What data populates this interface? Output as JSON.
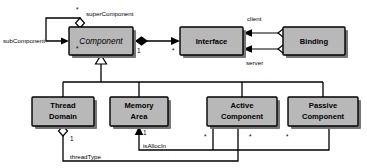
{
  "diagram": {
    "type": "uml-class-diagram",
    "background_color": "#ffffff",
    "box_fill_color": "#b8b8b8",
    "box_border_color": "#000000",
    "shadow_color": "#777777",
    "classes": [
      {
        "id": "component",
        "name": "Component",
        "abstract": true,
        "x": 69,
        "y": 27,
        "w": 64,
        "h": 28
      },
      {
        "id": "interface",
        "name": "Interface",
        "abstract": false,
        "x": 180,
        "y": 27,
        "w": 63,
        "h": 28
      },
      {
        "id": "binding",
        "name": "Binding",
        "abstract": false,
        "x": 283,
        "y": 27,
        "w": 62,
        "h": 28
      },
      {
        "id": "thread-domain",
        "name_line1": "Thread",
        "name_line2": "Domain",
        "abstract": false,
        "x": 32,
        "y": 97,
        "w": 62,
        "h": 29
      },
      {
        "id": "memory-area",
        "name_line1": "Memory",
        "name_line2": "Area",
        "abstract": false,
        "x": 110,
        "y": 97,
        "w": 58,
        "h": 29
      },
      {
        "id": "active-component",
        "name_line1": "Active",
        "name_line2": "Component",
        "abstract": false,
        "x": 207,
        "y": 97,
        "w": 70,
        "h": 29
      },
      {
        "id": "passive-component",
        "name_line1": "Passive",
        "name_line2": "Component",
        "abstract": false,
        "x": 288,
        "y": 97,
        "w": 70,
        "h": 29
      }
    ],
    "role_labels": [
      {
        "id": "super-component",
        "text": "superComponent",
        "x": 86,
        "y": 14
      },
      {
        "id": "sub-component",
        "text": "subComponent",
        "x": 3,
        "y": 41
      },
      {
        "id": "client",
        "text": "client",
        "x": 247,
        "y": 19
      },
      {
        "id": "server",
        "text": "server",
        "x": 246,
        "y": 63
      },
      {
        "id": "thread-type",
        "text": "threadType",
        "x": 70,
        "y": 157
      },
      {
        "id": "is-alloc-in",
        "text": "isAllocIn",
        "x": 143,
        "y": 146
      }
    ],
    "multiplicity_labels": [
      {
        "id": "super-component-mult",
        "text": "*",
        "x": 76,
        "y": 10
      },
      {
        "id": "sub-component-mult",
        "text": "*",
        "x": 76,
        "y": 49
      },
      {
        "id": "component-interface-mult-1",
        "text": "1",
        "x": 137,
        "y": 51
      },
      {
        "id": "component-interface-mult-star",
        "text": "*",
        "x": 172,
        "y": 51
      },
      {
        "id": "thread-type-mult",
        "text": "1",
        "x": 70,
        "y": 139
      },
      {
        "id": "is-alloc-in-mult",
        "text": "1",
        "x": 143,
        "y": 133
      },
      {
        "id": "active-left-mult",
        "text": "*",
        "x": 204,
        "y": 137
      },
      {
        "id": "active-right-mult",
        "text": "*",
        "x": 249,
        "y": 137
      },
      {
        "id": "passive-mult",
        "text": "*",
        "x": 286,
        "y": 137
      }
    ],
    "relationships": [
      {
        "id": "component-self-aggregation",
        "kind": "aggregation",
        "from": "component",
        "to": "component",
        "source_role": "subComponent",
        "target_role": "superComponent"
      },
      {
        "id": "component-interface-composition",
        "kind": "composition",
        "from": "component",
        "to": "interface",
        "source_mult": "1",
        "target_mult": "*"
      },
      {
        "id": "binding-client-interface",
        "kind": "aggregation",
        "from": "binding",
        "to": "interface",
        "role": "client"
      },
      {
        "id": "binding-server-interface",
        "kind": "aggregation",
        "from": "binding",
        "to": "interface",
        "role": "server"
      },
      {
        "id": "thread-domain-generalization",
        "kind": "generalization",
        "from": "thread-domain",
        "to": "component"
      },
      {
        "id": "memory-area-generalization",
        "kind": "generalization",
        "from": "memory-area",
        "to": "component"
      },
      {
        "id": "active-component-generalization",
        "kind": "generalization",
        "from": "active-component",
        "to": "component"
      },
      {
        "id": "passive-component-generalization",
        "kind": "generalization",
        "from": "passive-component",
        "to": "component"
      },
      {
        "id": "active-thread-domain-aggregation",
        "kind": "aggregation",
        "from": "active-component",
        "to": "thread-domain",
        "role": "threadType",
        "mult": "1"
      },
      {
        "id": "component-memory-area-association",
        "kind": "association",
        "from": "passive-component",
        "to": "memory-area",
        "role": "isAllocIn",
        "mult": "1"
      }
    ]
  }
}
